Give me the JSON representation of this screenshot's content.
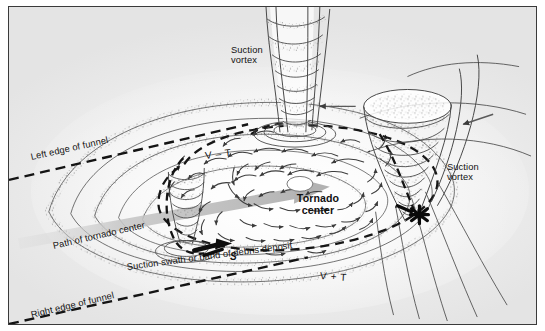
{
  "figure": {
    "type": "scientific-diagram",
    "background_color": "#f0f0f0",
    "border_color": "#3a3a3a",
    "ink_color": "#2b2b2b"
  },
  "labels": {
    "suction_vortex_top": "Suction\nvortex",
    "suction_vortex_top_line1": "Suction",
    "suction_vortex_top_line2": "vortex",
    "suction_vortex_right_line1": "Suction",
    "suction_vortex_right_line2": "vortex",
    "tornado_center_line1": "Tornado",
    "tornado_center_line2": "center",
    "v_minus_t": "V – T",
    "v_plus_t": "V + T",
    "left_edge_of_funnel": "Left edge of funnel",
    "right_edge_of_funnel": "Right edge of funnel",
    "path_of_tornado_center": "Path of tornado center",
    "suction_swath": "Suction swath or band of debris deposit",
    "s_marker": "S"
  },
  "elements": {
    "vortices": [
      {
        "name": "top-suction-vortex",
        "position": "top-center"
      },
      {
        "name": "right-suction-vortex",
        "position": "right"
      },
      {
        "name": "left-suction-vortex",
        "position": "center-left"
      }
    ],
    "markers": {
      "tornado_center_dot": "white-ellipse",
      "damage_point": "asterisk-star",
      "motion_arrow": "grey-translation-arrow"
    },
    "dashed_lines": [
      "left-edge-of-funnel",
      "right-edge-of-funnel",
      "inner-dashed-ellipse",
      "outer-dashed-ellipse"
    ],
    "flow": {
      "streamlines": "nested-spiral-contours",
      "arrows": "cyclonic-inflow-arrow-field",
      "debris": "stippled-debris-bands"
    }
  },
  "colors": {
    "ink": "#2b2b2b",
    "line": "#444444",
    "grey_arrow": "#b5b5b5",
    "debris": "#595959",
    "plate_bg": "#efefef"
  }
}
